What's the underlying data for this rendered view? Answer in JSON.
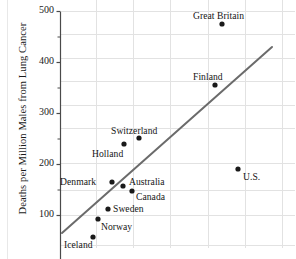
{
  "chart_data": {
    "type": "scatter",
    "title": "",
    "xlabel": "",
    "ylabel": "Deaths per Million Males from Lung Cancer",
    "ylim": [
      45,
      500
    ],
    "yticks": [
      100,
      200,
      300,
      400,
      500
    ],
    "ytick_labels": [
      "100",
      "200",
      "300",
      "400",
      "500"
    ],
    "yminor_ticks": [
      150,
      250,
      350,
      450
    ],
    "xlim": [
      0,
      1
    ],
    "xticks": [],
    "xtick_labels": [],
    "grid": true,
    "legend": "none",
    "points": [
      {
        "label": "Great Britain",
        "y": 468,
        "px": 222,
        "py": 24,
        "lx": 193,
        "ly": 10,
        "anchor": "above"
      },
      {
        "label": "Finland",
        "y": 350,
        "px": 215,
        "py": 85,
        "lx": 193,
        "ly": 71,
        "anchor": "above"
      },
      {
        "label": "U.S.",
        "y": 191,
        "px": 238,
        "py": 169,
        "lx": 243,
        "ly": 171,
        "anchor": "right"
      },
      {
        "label": "Switzerland",
        "y": 250,
        "px": 139,
        "py": 138,
        "lx": 111,
        "ly": 125,
        "anchor": "above"
      },
      {
        "label": "Holland",
        "y": 239,
        "px": 124,
        "py": 144,
        "lx": 92,
        "ly": 148,
        "anchor": "below"
      },
      {
        "label": "Denmark",
        "y": 162,
        "px": 112,
        "py": 182,
        "lx": 60,
        "ly": 176,
        "anchor": "left"
      },
      {
        "label": "Australia",
        "y": 166,
        "px": 123,
        "py": 186,
        "lx": 129,
        "ly": 176,
        "anchor": "right"
      },
      {
        "label": "Canada",
        "y": 151,
        "px": 132,
        "py": 191,
        "lx": 136,
        "ly": 191,
        "anchor": "right"
      },
      {
        "label": "Sweden",
        "y": 115,
        "px": 108,
        "py": 209,
        "lx": 113,
        "ly": 203,
        "anchor": "right"
      },
      {
        "label": "Norway",
        "y": 91,
        "px": 98,
        "py": 219,
        "lx": 101,
        "ly": 221,
        "anchor": "right"
      },
      {
        "label": "Iceland",
        "y": 59,
        "px": 93,
        "py": 237,
        "lx": 64,
        "ly": 239,
        "anchor": "below"
      }
    ],
    "trend_line": {
      "x1": 62,
      "y1": 233,
      "x2": 272,
      "y2": 47,
      "color": "#6b6b6b",
      "description": "fitted straight line"
    },
    "gridlines": {
      "vertical_px": [
        96,
        133,
        170,
        208,
        245,
        282
      ],
      "horizontal_px": [
        11,
        34,
        58,
        81,
        105,
        128,
        163,
        190,
        215,
        245
      ],
      "color": "#e2e2e2"
    },
    "axis": {
      "spine_x_px": 60,
      "spine_color": "#4a4a4a",
      "y_500_px": 11,
      "y_100_px": 215
    },
    "point_style": {
      "color": "#1a1a1a",
      "radius": 2.6
    }
  }
}
